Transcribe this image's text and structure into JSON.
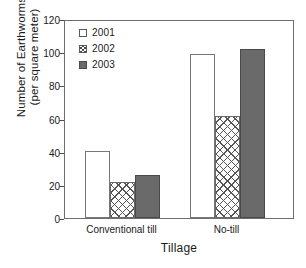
{
  "chart_data": {
    "type": "bar",
    "title": "",
    "xlabel": "Tillage",
    "ylabel": "Number of Earthworms (per square meter)",
    "ylabel_lines": [
      "Number of Earthworms",
      "(per square meter)"
    ],
    "categories": [
      "Conventional till",
      "No-till"
    ],
    "series": [
      {
        "name": "2001",
        "values": [
          41,
          100
        ],
        "fill": "white",
        "color": "#ffffff"
      },
      {
        "name": "2002",
        "values": [
          22,
          62
        ],
        "fill": "crosshatch",
        "color": "#ffffff"
      },
      {
        "name": "2003",
        "values": [
          26,
          103
        ],
        "fill": "solid",
        "color": "#6a6a6a"
      }
    ],
    "ylim": [
      0,
      120
    ],
    "yticks": [
      0,
      20,
      40,
      60,
      80,
      100,
      120
    ],
    "ytick_labels": [
      "0",
      "20",
      "40",
      "60",
      "80",
      "100",
      "120"
    ],
    "grid": false,
    "legend_position": "top-left-inside",
    "legend_entries": [
      "2001",
      "2002",
      "2003"
    ],
    "axis_line_color": "#6e6e6e"
  },
  "legend": {
    "items": [
      {
        "label": "2001",
        "swatch": "legend-swatch-white"
      },
      {
        "label": "2002",
        "swatch": "legend-swatch-crosshatch"
      },
      {
        "label": "2003",
        "swatch": "legend-swatch-solid-gray"
      }
    ]
  },
  "axes": {
    "y_title_line1": "Number of Earthworms",
    "y_title_line2": "(per square meter)",
    "x_title": "Tillage",
    "y_ticks": [
      "120",
      "100",
      "80",
      "60",
      "40",
      "20",
      "0"
    ],
    "x_categories": [
      "Conventional till",
      "No-till"
    ]
  }
}
